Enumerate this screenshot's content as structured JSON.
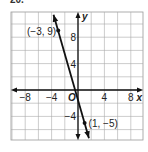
{
  "problem_label": "20.",
  "chart_data": {
    "type": "line",
    "title": "",
    "xlabel": "x",
    "ylabel": "y",
    "xlim": [
      -10,
      10
    ],
    "ylim": [
      -8,
      12
    ],
    "grid": true,
    "grid_step": 2,
    "x_ticks": [
      -8,
      -4,
      4,
      8
    ],
    "x_tick_labels": [
      "−8",
      "−4",
      "4",
      "8"
    ],
    "y_ticks": [
      8,
      4,
      -4
    ],
    "y_tick_labels": [
      "8",
      "4",
      "−4"
    ],
    "origin_label": "O",
    "series": [
      {
        "name": "line",
        "points": [
          {
            "x": -3,
            "y": 9
          },
          {
            "x": 1,
            "y": -5
          }
        ],
        "equation_slope": -3.5,
        "equation_intercept": -1.5
      }
    ],
    "annotations": [
      {
        "text": "(−3, 9)",
        "x": -3,
        "y": 9
      },
      {
        "text": "(1, −5)",
        "x": 1,
        "y": -5
      }
    ]
  }
}
